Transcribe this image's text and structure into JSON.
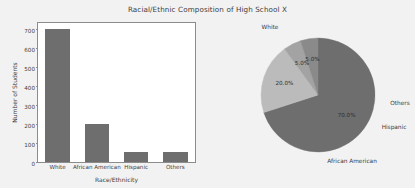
{
  "figure": {
    "title": "Racial/Ethnic Composition of High School X",
    "background_color": "#f2f2f2",
    "axes_background_color": "#ffffff"
  },
  "chart_data": [
    {
      "type": "bar",
      "title": "",
      "categories": [
        "White",
        "African American",
        "Hispanic",
        "Others"
      ],
      "values": [
        700,
        200,
        50,
        50
      ],
      "xlabel": "Race/Ethnicity",
      "ylabel": "Number of Students",
      "ylim": [
        0,
        730
      ],
      "yticks": [
        0,
        100,
        200,
        300,
        400,
        500,
        600,
        700
      ],
      "ytick_labels": [
        "0",
        "100",
        "200",
        "300",
        "400",
        "500",
        "600",
        "700"
      ],
      "grid": false,
      "legend": "none",
      "bar_color": "#6e6e6e"
    },
    {
      "type": "pie",
      "title": "",
      "labels": [
        "White",
        "African American",
        "Hispanic",
        "Others"
      ],
      "values": [
        70.0,
        20.0,
        5.0,
        5.0
      ],
      "pct_labels": [
        "70.0%",
        "20.0%",
        "5.0%",
        "5.0%"
      ],
      "colors": [
        "#6e6e6e",
        "#bbbbbb",
        "#a3a3a3",
        "#8a8a8a"
      ],
      "legend": "none",
      "startangle": 0,
      "counterclock": false
    }
  ]
}
